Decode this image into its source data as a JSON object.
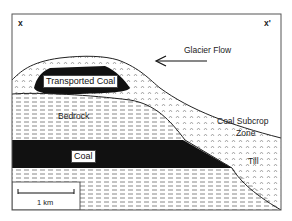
{
  "diagram": {
    "section_left_label": "x",
    "section_right_label": "x'",
    "arrow_label": "Glacier Flow",
    "labels": {
      "transported_coal": "Transported Coal",
      "bedrock": "Bedrock",
      "coal": "Coal",
      "subcrop_line1": "Coal  Subcrop",
      "subcrop_line2": "Zone",
      "till": "Till"
    },
    "scale_bar": {
      "label": "1 km"
    },
    "colors": {
      "coal": "#111111",
      "line": "#222222",
      "background": "#ffffff",
      "hatch": "#777777"
    }
  }
}
